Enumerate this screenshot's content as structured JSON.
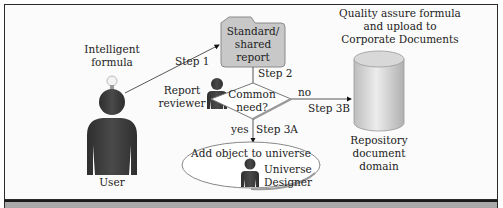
{
  "diagram": {
    "actors": {
      "user": "User",
      "report_reviewer": [
        "Report",
        "reviewer"
      ],
      "universe_designer": [
        "Universe",
        "Designer"
      ]
    },
    "idea": [
      "Intelligent",
      "formula"
    ],
    "document": [
      "Standard/",
      "shared",
      "report"
    ],
    "decision": [
      "Common",
      "need?"
    ],
    "quality_note": [
      "Quality assure formula",
      "and upload to",
      "Corporate Documents"
    ],
    "repository": [
      "Repository",
      "document",
      "domain"
    ],
    "universe_action": "Add object to universe",
    "steps": {
      "step1": "Step 1",
      "step2": "Step 2",
      "step3a": "Step 3A",
      "step3b": "Step 3B",
      "yes": "yes",
      "no": "no"
    },
    "colors": {
      "figure": "#3a3a3a",
      "document_fill": "#c8c8c8",
      "cylinder_fill": "#d4d4d4",
      "band": "#a9a9a9"
    }
  }
}
